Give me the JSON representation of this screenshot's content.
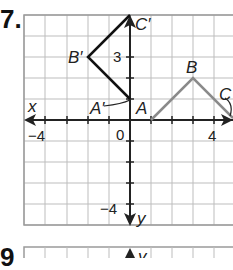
{
  "problems": [
    {
      "number": "7.",
      "id": "problem-7"
    },
    {
      "number": "9",
      "id": "problem-9-partial"
    }
  ],
  "graph": {
    "x_axis_label": "x",
    "y_axis_label": "y",
    "origin_label": "0",
    "tick_labels": {
      "x_neg": "−4",
      "x_pos": "4",
      "y_pos": "3",
      "y_neg": "−4"
    },
    "original_triangle": {
      "color": "#8a8a8a",
      "points": [
        {
          "label": "A",
          "x": 1,
          "y": 0
        },
        {
          "label": "B",
          "x": 3,
          "y": 2
        },
        {
          "label": "C",
          "x": 5,
          "y": 0
        }
      ]
    },
    "image_triangle": {
      "color": "#111111",
      "points": [
        {
          "label": "A′",
          "x": 0,
          "y": 1
        },
        {
          "label": "B′",
          "x": -2,
          "y": 3
        },
        {
          "label": "C′",
          "x": 0,
          "y": 5
        }
      ]
    }
  },
  "next_graph": {
    "y_axis_label": "y"
  }
}
